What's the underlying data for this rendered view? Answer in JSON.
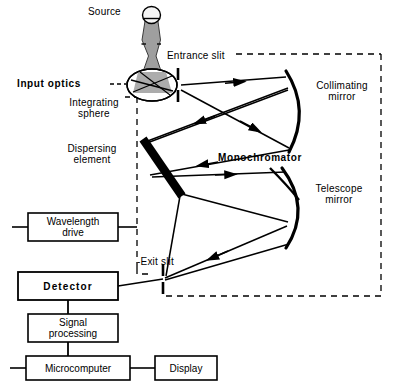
{
  "diagram": {
    "colors": {
      "line": "#000000",
      "background": "#ffffff",
      "beam_fill": "#9a9a9a",
      "lamp_fill": "#f2f2f2",
      "sphere_fill": "#a8a8a8",
      "dashed": "#000000"
    },
    "labels": {
      "source": "Source",
      "entrance_slit": "Entrance slit",
      "input_optics": "Input optics",
      "integrating_sphere": "Integrating\nsphere",
      "collimating_mirror": "Collimating\nmirror",
      "dispersing_element": "Dispersing\nelement",
      "monochromator": "Monochromator",
      "telescope_mirror": "Telescope\nmirror",
      "exit_slit": "-Exit slit",
      "wavelength_drive": "Wavelength\ndrive",
      "detector": "Detector",
      "signal_processing": "Signal\nprocessing",
      "microcomputer": "Microcomputer",
      "display": "Display"
    },
    "components": [
      {
        "name": "source-lamp",
        "type": "lamp"
      },
      {
        "name": "integrating-sphere",
        "type": "ellipse"
      },
      {
        "name": "entrance-slit",
        "type": "slit"
      },
      {
        "name": "collimating-mirror",
        "type": "curved-mirror"
      },
      {
        "name": "dispersing-element",
        "type": "grating-bar"
      },
      {
        "name": "telescope-mirror",
        "type": "curved-mirror"
      },
      {
        "name": "exit-slit",
        "type": "slit"
      },
      {
        "name": "wavelength-drive",
        "type": "box"
      },
      {
        "name": "detector",
        "type": "box"
      },
      {
        "name": "signal-processing",
        "type": "box"
      },
      {
        "name": "microcomputer",
        "type": "box"
      },
      {
        "name": "display",
        "type": "box"
      }
    ]
  }
}
